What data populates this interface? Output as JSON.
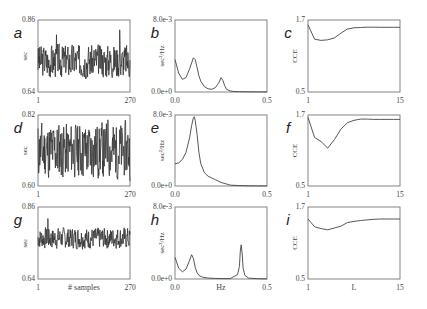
{
  "chart_data": [
    {
      "panel": "a",
      "type": "line",
      "column": "time-series",
      "ylabel": "sec",
      "xlabel": "",
      "xlim": [
        1,
        270
      ],
      "ylim": [
        0.64,
        0.86
      ],
      "x_ticks": [
        "1",
        "270"
      ],
      "y_ticks": [
        "0.64",
        "0.86"
      ],
      "series": [
        {
          "name": "RR",
          "mean": 0.735,
          "spread": 0.035,
          "seed": 3,
          "peaks": [
            {
              "x": 240,
              "y": 0.83
            },
            {
              "x": 55,
              "y": 0.815
            }
          ]
        }
      ]
    },
    {
      "panel": "b",
      "type": "line",
      "column": "spectrum",
      "ylabel": "sec²/Hz",
      "xlabel": "",
      "xlim": [
        0.0,
        0.5
      ],
      "ylim": [
        0.0,
        0.008
      ],
      "x_ticks": [
        "0.0",
        "0.5"
      ],
      "y_ticks": [
        "0.0e+0",
        "8.0e-3"
      ],
      "x": [
        0.0,
        0.02,
        0.04,
        0.06,
        0.08,
        0.1,
        0.11,
        0.12,
        0.13,
        0.14,
        0.16,
        0.18,
        0.2,
        0.22,
        0.24,
        0.25,
        0.26,
        0.27,
        0.28,
        0.3,
        0.32,
        0.35,
        0.4,
        0.45,
        0.5
      ],
      "values": [
        0.0036,
        0.0021,
        0.0014,
        0.0016,
        0.0026,
        0.0038,
        0.0036,
        0.0027,
        0.0018,
        0.0012,
        0.0006,
        0.00035,
        0.0003,
        0.0005,
        0.0011,
        0.0016,
        0.0013,
        0.0007,
        0.0003,
        0.00012,
        6e-05,
        3e-05,
        2e-05,
        1e-05,
        1e-05
      ]
    },
    {
      "panel": "c",
      "type": "line",
      "column": "CCE",
      "ylabel": "CCE",
      "xlabel": "",
      "xlim": [
        1,
        15
      ],
      "ylim": [
        0.5,
        1.7
      ],
      "x_ticks": [
        "1",
        "15"
      ],
      "y_ticks": [
        "0.5",
        "1.7"
      ],
      "x": [
        1,
        2,
        3,
        4,
        5,
        6,
        7,
        8,
        9,
        10,
        11,
        12,
        13,
        14,
        15
      ],
      "values": [
        1.62,
        1.38,
        1.36,
        1.37,
        1.4,
        1.48,
        1.55,
        1.57,
        1.575,
        1.58,
        1.58,
        1.578,
        1.578,
        1.578,
        1.578
      ]
    },
    {
      "panel": "d",
      "type": "line",
      "column": "time-series",
      "ylabel": "sec",
      "xlabel": "",
      "xlim": [
        1,
        270
      ],
      "ylim": [
        0.6,
        0.82
      ],
      "x_ticks": [
        "1",
        "270"
      ],
      "y_ticks": [
        "0.60",
        "0.82"
      ],
      "series": [
        {
          "name": "RR",
          "mean": 0.71,
          "spread": 0.06,
          "seed": 11,
          "peaks": [
            {
              "x": 205,
              "y": 0.805
            }
          ]
        }
      ]
    },
    {
      "panel": "e",
      "type": "line",
      "column": "spectrum",
      "ylabel": "sec²/Hz",
      "xlabel": "",
      "xlim": [
        0.0,
        0.5
      ],
      "ylim": [
        0.0,
        0.008
      ],
      "x_ticks": [
        "0.0",
        "0.5"
      ],
      "y_ticks": [
        "0.0e+0",
        "8.0e-3"
      ],
      "x": [
        0.0,
        0.02,
        0.04,
        0.06,
        0.08,
        0.09,
        0.1,
        0.105,
        0.11,
        0.12,
        0.13,
        0.14,
        0.16,
        0.18,
        0.2,
        0.22,
        0.25,
        0.3,
        0.35,
        0.4,
        0.45,
        0.5
      ],
      "values": [
        0.0025,
        0.0026,
        0.003,
        0.0038,
        0.0055,
        0.0068,
        0.0077,
        0.0078,
        0.0074,
        0.0058,
        0.0038,
        0.0025,
        0.0015,
        0.0011,
        0.0009,
        0.0007,
        0.0004,
        0.0001,
        4e-05,
        2e-05,
        1e-05,
        1e-05
      ]
    },
    {
      "panel": "f",
      "type": "line",
      "column": "CCE",
      "ylabel": "CCE",
      "xlabel": "",
      "xlim": [
        1,
        15
      ],
      "ylim": [
        0.5,
        1.7
      ],
      "x_ticks": [
        "1",
        "15"
      ],
      "y_ticks": [
        "0.5",
        "1.7"
      ],
      "x": [
        1,
        2,
        3,
        4,
        5,
        6,
        7,
        8,
        9,
        10,
        11,
        12,
        13,
        14,
        15
      ],
      "values": [
        1.66,
        1.32,
        1.25,
        1.14,
        1.28,
        1.46,
        1.57,
        1.61,
        1.63,
        1.63,
        1.625,
        1.625,
        1.625,
        1.625,
        1.625
      ]
    },
    {
      "panel": "g",
      "type": "line",
      "column": "time-series",
      "ylabel": "sec",
      "xlabel": "# samples",
      "xlim": [
        1,
        270
      ],
      "ylim": [
        0.64,
        0.86
      ],
      "x_ticks": [
        "1",
        "270"
      ],
      "y_ticks": [
        "0.64",
        "0.86"
      ],
      "series": [
        {
          "name": "RR",
          "mean": 0.765,
          "spread": 0.022,
          "seed": 7,
          "peaks": [
            {
              "x": 30,
              "y": 0.825
            }
          ]
        }
      ]
    },
    {
      "panel": "h",
      "type": "line",
      "column": "spectrum",
      "ylabel": "sec²/Hz",
      "xlabel": "Hz",
      "xlim": [
        0.0,
        0.5
      ],
      "ylim": [
        0.0,
        0.008
      ],
      "x_ticks": [
        "0.0",
        "0.5"
      ],
      "y_ticks": [
        "0.0e+0",
        "8.0e-3"
      ],
      "x": [
        0.0,
        0.02,
        0.04,
        0.06,
        0.08,
        0.09,
        0.1,
        0.11,
        0.12,
        0.13,
        0.15,
        0.18,
        0.22,
        0.26,
        0.3,
        0.34,
        0.35,
        0.355,
        0.36,
        0.365,
        0.37,
        0.38,
        0.4,
        0.45,
        0.5
      ],
      "values": [
        0.0024,
        0.0012,
        0.0008,
        0.0011,
        0.0021,
        0.0027,
        0.0023,
        0.0013,
        0.0007,
        0.0004,
        0.0002,
        0.0001,
        7e-05,
        5e-05,
        5e-05,
        0.0005,
        0.0014,
        0.0031,
        0.0038,
        0.0028,
        0.0012,
        0.0004,
        0.0001,
        3e-05,
        1e-05
      ]
    },
    {
      "panel": "i",
      "type": "line",
      "column": "CCE",
      "ylabel": "CCE",
      "xlabel": "L",
      "xlim": [
        1,
        15
      ],
      "ylim": [
        0.5,
        1.7
      ],
      "x_ticks": [
        "1",
        "15"
      ],
      "y_ticks": [
        "0.5",
        "1.7"
      ],
      "x": [
        1,
        2,
        3,
        4,
        5,
        6,
        7,
        8,
        9,
        10,
        11,
        12,
        13,
        14,
        15
      ],
      "values": [
        1.5,
        1.37,
        1.34,
        1.32,
        1.35,
        1.38,
        1.44,
        1.46,
        1.475,
        1.485,
        1.495,
        1.5,
        1.5,
        1.5,
        1.5
      ]
    }
  ]
}
